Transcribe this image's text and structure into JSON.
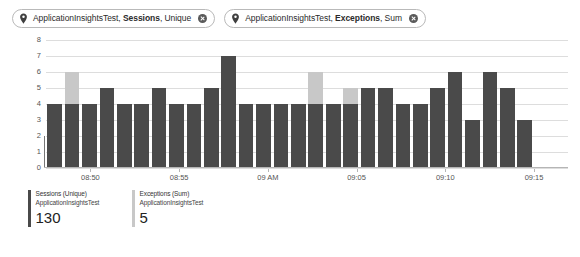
{
  "filters": {
    "chips": [
      {
        "icon": "location-pin-icon",
        "resource": "ApplicationInsightsTest, ",
        "metric": "Sessions",
        "aggregation": ", Unique",
        "close_label": "×"
      },
      {
        "icon": "location-pin-icon",
        "resource": "ApplicationInsightsTest, ",
        "metric": "Exceptions",
        "aggregation": ", Sum",
        "close_label": "×"
      }
    ]
  },
  "legend": {
    "items": [
      {
        "metric": "Sessions (Unique)",
        "resource": "ApplicationInsightsTest",
        "value": "130",
        "color": "#4a4a4a"
      },
      {
        "metric": "Exceptions (Sum)",
        "resource": "ApplicationInsightsTest",
        "value": "5",
        "color": "#c8c8c8"
      }
    ]
  },
  "chart_data": {
    "type": "bar",
    "title": "",
    "subtitle": "",
    "xlabel": "",
    "ylabel": "",
    "stacked": true,
    "grid": true,
    "legend_position": "bottom",
    "ylim": [
      0,
      8
    ],
    "yticks": [
      0,
      1,
      2,
      3,
      4,
      5,
      6,
      7,
      8
    ],
    "ytick_labels": [
      "0",
      "1",
      "2",
      "3",
      "4",
      "5",
      "6",
      "7",
      "8"
    ],
    "xtick_labels": [
      "08:50",
      "08:55",
      "09 AM",
      "09:05",
      "09:10",
      "09:15"
    ],
    "xtick_positions_pct": [
      8.5,
      25.5,
      42.5,
      59.5,
      76.5,
      93.5
    ],
    "categories": [
      "b1",
      "b2",
      "b3",
      "b4",
      "b5",
      "b6",
      "b7",
      "b8",
      "b9",
      "b10",
      "b11",
      "b12",
      "b13",
      "b14",
      "b15",
      "b16",
      "b17",
      "b18",
      "b19",
      "b20",
      "b21",
      "b22",
      "b23",
      "b24",
      "b25",
      "b26",
      "b27",
      "b28",
      "b29",
      "b30"
    ],
    "series": [
      {
        "name": "Sessions (Unique)",
        "color": "#4a4a4a",
        "values": [
          4,
          4,
          4,
          5,
          4,
          4,
          5,
          4,
          4,
          5,
          7,
          4,
          4,
          4,
          4,
          4,
          4,
          4,
          5,
          5,
          4,
          4,
          5,
          6,
          3,
          6,
          5,
          3,
          0,
          0
        ]
      },
      {
        "name": "Exceptions (Sum)",
        "color": "#c8c8c8",
        "values": [
          0,
          2,
          0,
          0,
          0,
          0,
          0,
          0,
          0,
          0,
          0,
          0,
          0,
          0,
          0,
          2,
          0,
          1,
          0,
          0,
          0,
          0,
          0,
          0,
          0,
          0,
          0,
          0,
          0,
          0
        ]
      }
    ]
  },
  "colors": {
    "sessions": "#4a4a4a",
    "exceptions": "#c8c8c8",
    "grid": "#dddddd",
    "axis": "#b5b5b5",
    "chip_border": "#b9b9b9"
  }
}
